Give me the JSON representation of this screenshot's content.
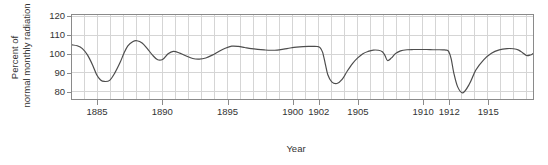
{
  "chart_data": {
    "type": "line",
    "title": "",
    "xlabel": "Year",
    "ylabel_line1": "Percent of",
    "ylabel_line2": "normal monthly radiation",
    "ylabel": "Percent of normal monthly radiation",
    "xlim": [
      1883,
      1918.5
    ],
    "ylim": [
      76,
      121
    ],
    "yticks": [
      120,
      110,
      100,
      90,
      80
    ],
    "xticks": [
      1885,
      1890,
      1895,
      1900,
      1902,
      1905,
      1910,
      1912,
      1915
    ],
    "xtick_labels": [
      "1885",
      "1890",
      "1895",
      "1900",
      "1902",
      "1905",
      "1910",
      "1912",
      "1915"
    ],
    "grid": "both",
    "grid_x_step": 1,
    "grid_y_step": 10,
    "legend": "none",
    "line_color": "#4d4d4d",
    "grid_color": "#d4d4d4",
    "axis_color": "#8a8a8a",
    "series": [
      {
        "name": "Percent of normal monthly radiation",
        "x": [
          1883.0,
          1883.4,
          1883.8,
          1884.2,
          1884.6,
          1884.9,
          1885.2,
          1885.5,
          1885.9,
          1886.3,
          1886.7,
          1887.0,
          1887.3,
          1887.7,
          1888.0,
          1888.4,
          1888.8,
          1889.2,
          1889.6,
          1890.0,
          1890.4,
          1890.8,
          1891.3,
          1891.8,
          1892.3,
          1892.8,
          1893.3,
          1893.8,
          1894.3,
          1894.8,
          1895.3,
          1895.8,
          1896.3,
          1896.8,
          1897.3,
          1897.8,
          1898.3,
          1898.8,
          1899.3,
          1899.8,
          1900.3,
          1900.8,
          1901.2,
          1901.6,
          1901.9,
          1902.1,
          1902.3,
          1902.5,
          1902.7,
          1903.0,
          1903.4,
          1903.8,
          1904.2,
          1904.6,
          1905.0,
          1905.4,
          1905.8,
          1906.2,
          1906.6,
          1906.9,
          1907.1,
          1907.3,
          1907.6,
          1907.9,
          1908.3,
          1908.8,
          1909.3,
          1909.8,
          1910.3,
          1910.8,
          1911.3,
          1911.6,
          1911.8,
          1912.0,
          1912.2,
          1912.4,
          1912.7,
          1913.1,
          1913.6,
          1914.1,
          1914.7,
          1915.3,
          1915.9,
          1916.5,
          1917.0,
          1917.4,
          1917.7,
          1918.0,
          1918.3,
          1918.5
        ],
        "y": [
          105.0,
          104.5,
          103.0,
          99.5,
          94.0,
          89.0,
          86.2,
          85.4,
          86.0,
          90.0,
          95.5,
          100.5,
          104.5,
          106.8,
          107.2,
          106.0,
          103.0,
          99.5,
          97.0,
          97.3,
          100.2,
          101.5,
          100.6,
          99.0,
          97.7,
          97.4,
          98.0,
          99.5,
          101.5,
          103.2,
          104.3,
          104.2,
          103.6,
          103.0,
          102.6,
          102.3,
          102.1,
          102.2,
          102.7,
          103.3,
          103.8,
          104.1,
          104.2,
          104.2,
          104.1,
          103.5,
          101.0,
          95.0,
          89.0,
          85.2,
          84.3,
          86.5,
          91.0,
          95.0,
          98.0,
          100.3,
          101.5,
          102.2,
          102.1,
          101.3,
          99.3,
          96.6,
          98.0,
          100.3,
          101.8,
          102.4,
          102.5,
          102.5,
          102.5,
          102.4,
          102.4,
          102.3,
          102.2,
          101.5,
          97.5,
          90.0,
          82.5,
          79.3,
          84.0,
          91.5,
          97.0,
          100.5,
          102.3,
          103.0,
          102.9,
          102.2,
          100.8,
          99.3,
          99.6,
          100.3
        ]
      }
    ]
  }
}
